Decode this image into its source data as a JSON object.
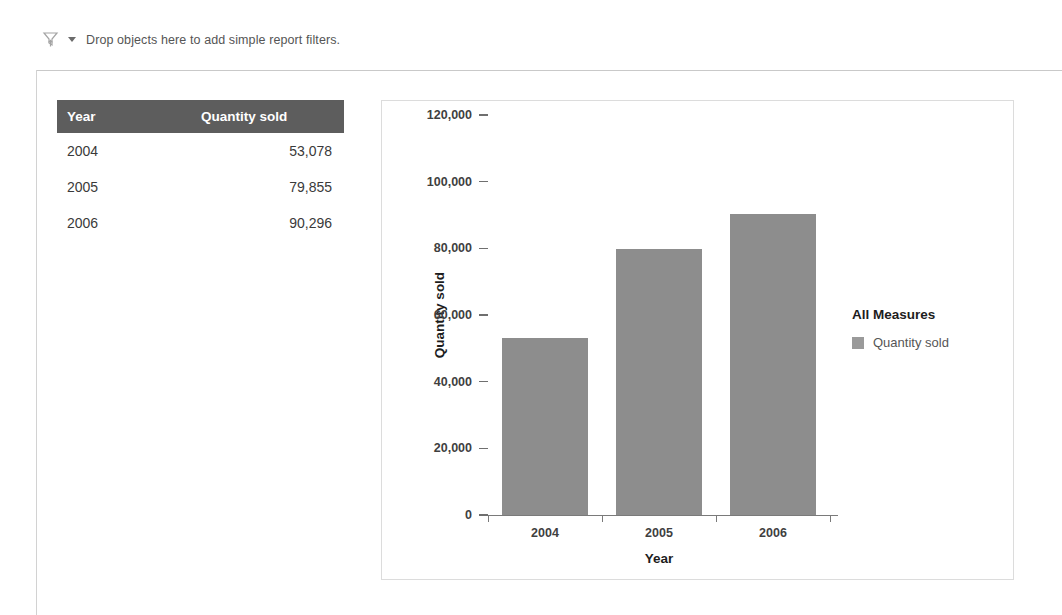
{
  "filter_bar": {
    "icon": "filter-funnel-icon",
    "dropdown_icon": "chevron-down-icon",
    "hint_text": "Drop objects here to add simple report filters."
  },
  "table": {
    "columns": [
      "Year",
      "Quantity sold"
    ],
    "rows": [
      {
        "year": "2004",
        "quantity": "53,078"
      },
      {
        "year": "2005",
        "quantity": "79,855"
      },
      {
        "year": "2006",
        "quantity": "90,296"
      }
    ]
  },
  "chart_data": {
    "type": "bar",
    "title": "",
    "categories": [
      "2004",
      "2005",
      "2006"
    ],
    "values": [
      53078,
      79855,
      90296
    ],
    "series": [
      {
        "name": "Quantity sold",
        "values": [
          53078,
          79855,
          90296
        ]
      }
    ],
    "xlabel": "Year",
    "ylabel": "Quantity sold",
    "ylim": [
      0,
      120000
    ],
    "ytick_labels": [
      "0",
      "20,000",
      "40,000",
      "60,000",
      "80,000",
      "100,000",
      "120,000"
    ],
    "ytick_values": [
      0,
      20000,
      40000,
      60000,
      80000,
      100000,
      120000
    ],
    "grid": false,
    "legend_position": "right",
    "legend": {
      "title": "All Measures",
      "entries": [
        "Quantity sold"
      ]
    },
    "bar_color": "#8d8d8d"
  }
}
